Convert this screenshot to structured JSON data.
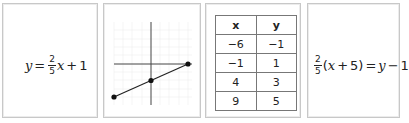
{
  "cards": [
    {
      "type": "equation",
      "label": "slope-intercept form",
      "lhs": "y",
      "equals": "=",
      "frac_num": "2",
      "frac_den": "5",
      "var": "x",
      "plus": "+",
      "const": "1"
    },
    {
      "type": "graph",
      "label": "graph of line",
      "points": [
        {
          "x": -6,
          "y": -1
        },
        {
          "x": -1,
          "y": 1
        },
        {
          "x": 4,
          "y": 3
        }
      ]
    },
    {
      "type": "table",
      "headers": [
        "x",
        "y"
      ],
      "rows": [
        [
          "−6",
          "−1"
        ],
        [
          "−1",
          "1"
        ],
        [
          "4",
          "3"
        ],
        [
          "9",
          "5"
        ]
      ]
    },
    {
      "type": "equation",
      "label": "point-slope form",
      "frac_num": "2",
      "frac_den": "5",
      "paren_open": "(",
      "var": "x",
      "plus": "+",
      "inner_const": "5",
      "paren_close": ")",
      "equals": "=",
      "rhs_var": "y",
      "minus": "−",
      "rhs_const": "1"
    }
  ],
  "colors": {
    "border": "#c8c8c8",
    "axis": "#444444",
    "grid": "#eeeeee",
    "line": "#222222",
    "table_border": "#777777"
  }
}
